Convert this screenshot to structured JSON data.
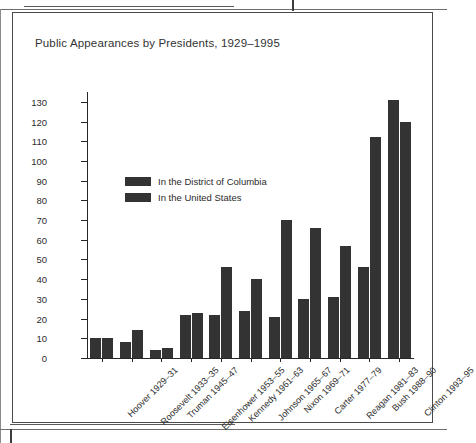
{
  "page": {
    "rule_top": "horizontal-rule",
    "rule_bottom": "horizontal-rule",
    "crop_tick": "crop-mark"
  },
  "figure": {
    "title": "Public Appearances by Presidents, 1929–1995"
  },
  "chart_data": {
    "type": "bar",
    "title": "Public Appearances by Presidents, 1929–1995",
    "xlabel": "",
    "ylabel": "Number of appearances",
    "ylim": [
      0,
      135
    ],
    "yticks": [
      0,
      10,
      20,
      30,
      40,
      50,
      60,
      70,
      80,
      90,
      100,
      110,
      120,
      130
    ],
    "grid": false,
    "legend_position": "upper-left-inside",
    "bar_color": "#333333",
    "categories": [
      "Hoover 1929–31",
      "Roosevelt 1933–35",
      "Truman 1945–47",
      "Eisenhower 1953–55",
      "Kennedy 1961–63",
      "Johnson 1965–67",
      "Nixon 1969–71",
      "Carter 1977–79",
      "Reagan 1981–83",
      "Bush 1988–90",
      "Clinton 1993–95"
    ],
    "series": [
      {
        "name": "In the District of Columbia",
        "values": [
          10,
          8,
          4,
          22,
          22,
          24,
          21,
          30,
          31,
          46,
          131
        ]
      },
      {
        "name": "In the United States",
        "values": [
          10,
          14,
          5,
          23,
          46,
          40,
          70,
          66,
          57,
          112,
          120
        ]
      }
    ]
  }
}
